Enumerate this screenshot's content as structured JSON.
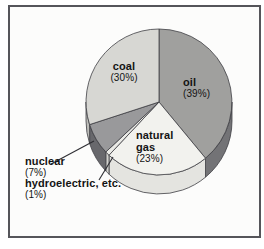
{
  "figure": {
    "panel_background": "#fcfcfb",
    "frame_border_color": "#55555a",
    "text_color": "#141414",
    "outline_color": "#3f3f44"
  },
  "chart_data": {
    "type": "pie",
    "title": "",
    "start_angle_deg": 0,
    "direction": "clockwise",
    "depth_px": 19,
    "legend_position": "labels-on-and-beside-slices",
    "slices": [
      {
        "name": "oil",
        "label": "oil",
        "percent_label": "(39%)",
        "value": 39,
        "color": "#a0a09e",
        "rim_color": "#737376"
      },
      {
        "name": "natural-gas",
        "label": "natural gas",
        "percent_label": "(23%)",
        "value": 23,
        "color": "#f2f2ee",
        "rim_color": "#e4e4e0"
      },
      {
        "name": "hydroelectric",
        "label": "hydroelectric, etc.",
        "percent_label": "(1%)",
        "value": 1,
        "color": "#eaeae6",
        "rim_color": "#d2d2ce"
      },
      {
        "name": "nuclear",
        "label": "nuclear",
        "percent_label": "(7%)",
        "value": 7,
        "color": "#99999b",
        "rim_color": "#68686c"
      },
      {
        "name": "coal",
        "label": "coal",
        "percent_label": "(30%)",
        "value": 30,
        "color": "#d7d7d3",
        "rim_color": "#bcbcb8"
      }
    ]
  }
}
